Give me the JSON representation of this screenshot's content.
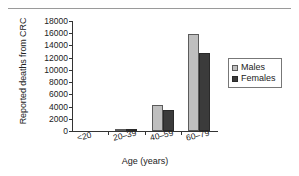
{
  "chart_data": {
    "type": "bar",
    "title": "",
    "xlabel": "Age (years)",
    "ylabel": "Reported deaths from CRC",
    "categories": [
      "<20",
      "20–39",
      "40–59",
      "60–79"
    ],
    "series": [
      {
        "name": "Males",
        "color": "#bfbfbf",
        "values": [
          0,
          350,
          4300,
          15800
        ]
      },
      {
        "name": "Females",
        "color": "#3b3b3b",
        "values": [
          0,
          300,
          3400,
          12800
        ]
      }
    ],
    "ylim": [
      0,
      18000
    ],
    "yticks": [
      0,
      2000,
      4000,
      6000,
      8000,
      10000,
      12000,
      14000,
      16000,
      18000
    ],
    "ytick_labels": [
      "0",
      "2000",
      "4000",
      "6000",
      "8000",
      "10000",
      "12000",
      "14000",
      "16000",
      "18000"
    ],
    "grid": false,
    "legend_position": "right"
  },
  "legend": {
    "items": [
      {
        "label": "Males"
      },
      {
        "label": "Females"
      }
    ]
  }
}
